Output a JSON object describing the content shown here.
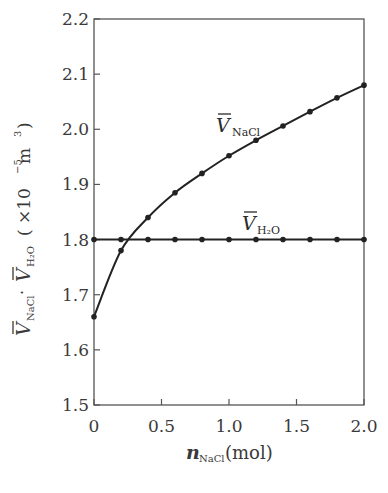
{
  "chart_data": {
    "type": "line",
    "title": "",
    "xlabel": {
      "main": "n",
      "sub": "NaCl",
      "unit": "(mol)"
    },
    "ylabel": {
      "v1_sub": "NaCl",
      "separator": "·",
      "v2_sub": "H₂O",
      "unit_prefix": "( ×10",
      "unit_exp": "−5",
      "unit_base": " m",
      "unit_pow": "3",
      "unit_close": ")"
    },
    "xlim": [
      0,
      2.0
    ],
    "ylim": [
      1.5,
      2.2
    ],
    "xticks": [
      0,
      0.5,
      1.0,
      1.5,
      2.0
    ],
    "xtick_labels": [
      "0",
      "0.5",
      "1.0",
      "1.5",
      "2.0"
    ],
    "yticks": [
      1.5,
      1.6,
      1.7,
      1.8,
      1.9,
      2.0,
      2.1,
      2.2
    ],
    "ytick_labels": [
      "1.5",
      "1.6",
      "1.7",
      "1.8",
      "1.9",
      "2.0",
      "2.1",
      "2.2"
    ],
    "grid": false,
    "legend": "none (inline series labels)",
    "x": [
      0,
      0.2,
      0.4,
      0.6,
      0.8,
      1.0,
      1.2,
      1.4,
      1.6,
      1.8,
      2.0
    ],
    "series": [
      {
        "name": "V̄ NaCl",
        "label_main": "V",
        "label_sub": "NaCl",
        "values": [
          1.66,
          1.78,
          1.84,
          1.885,
          1.92,
          1.952,
          1.98,
          2.006,
          2.032,
          2.057,
          2.08
        ],
        "marker": "circle",
        "color": "#222222"
      },
      {
        "name": "V̄ H2O",
        "label_main": "V",
        "label_sub": "H₂O",
        "values": [
          1.8,
          1.8,
          1.8,
          1.8,
          1.8,
          1.8,
          1.8,
          1.8,
          1.8,
          1.8,
          1.8
        ],
        "marker": "circle",
        "color": "#222222"
      }
    ]
  },
  "colors": {
    "axis": "#555555",
    "line": "#222222",
    "text": "#3a3a3a"
  }
}
